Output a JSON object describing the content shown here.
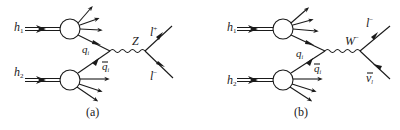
{
  "diagrams": [
    {
      "id": "a",
      "caption": "(a)",
      "hadron1": {
        "label": "h",
        "sub": "1"
      },
      "hadron2": {
        "label": "h",
        "sub": "2"
      },
      "quark": {
        "label": "q",
        "sub": "i"
      },
      "antiquark": {
        "label": "q",
        "sub": "i",
        "bar": true
      },
      "boson": {
        "label": "Z",
        "sup": ""
      },
      "lepton_top": {
        "label": "l",
        "sup": "+"
      },
      "lepton_bottom": {
        "label": "l",
        "sup": "−"
      }
    },
    {
      "id": "b",
      "caption": "(b)",
      "hadron1": {
        "label": "h",
        "sub": "1"
      },
      "hadron2": {
        "label": "h",
        "sub": "2"
      },
      "quark": {
        "label": "q",
        "sub": "i"
      },
      "antiquark": {
        "label": "q",
        "sub": "i",
        "bar": true
      },
      "boson": {
        "label": "W",
        "sup": "−"
      },
      "lepton_top": {
        "label": "l",
        "sup": "−"
      },
      "lepton_bottom": {
        "label": "ν",
        "sub": "l",
        "bar": true
      }
    }
  ],
  "colors": {
    "ink": "#1a1a1a",
    "background": "#ffffff"
  }
}
